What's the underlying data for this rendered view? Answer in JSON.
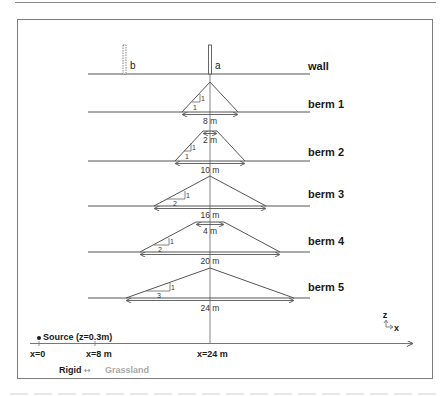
{
  "figure": {
    "rows": [
      {
        "id": "wall",
        "label": "wall"
      },
      {
        "id": "berm1",
        "label": "berm 1",
        "base_width": "8 m",
        "slope_run": "1",
        "slope_rise": "1"
      },
      {
        "id": "berm2",
        "label": "berm 2",
        "top_width": "2 m",
        "base_width": "10 m",
        "slope_run": "1",
        "slope_rise": "1"
      },
      {
        "id": "berm3",
        "label": "berm 3",
        "base_width": "16 m",
        "slope_run": "2",
        "slope_rise": "1"
      },
      {
        "id": "berm4",
        "label": "berm 4",
        "top_width": "4 m",
        "base_width": "20 m",
        "slope_run": "2",
        "slope_rise": "1"
      },
      {
        "id": "berm5",
        "label": "berm 5",
        "base_width": "24 m",
        "slope_run": "3",
        "slope_rise": "1"
      }
    ],
    "wall_labels": {
      "a": "a",
      "b": "b"
    },
    "source_label": "Source (z=0.3m)",
    "axis_ticks": [
      "x=0",
      "x=8 m",
      "x=24 m"
    ],
    "ground": {
      "rigid": "Rigid",
      "arrow": "↔",
      "grassland": "Grassland"
    },
    "axes_icon": {
      "z": "z",
      "x": "x"
    },
    "colors": {
      "line": "#555555",
      "text": "#1a1a1a",
      "muted": "#a8a8a8",
      "frame": "#7c7c7c"
    }
  }
}
